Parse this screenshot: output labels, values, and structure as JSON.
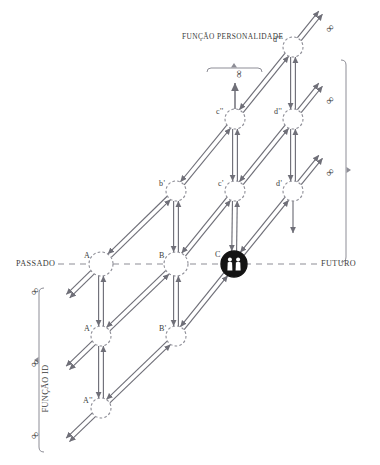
{
  "diagram": {
    "title": "FUNÇÃO PERSONALIDADE",
    "axis_left_label": "PASSADO",
    "axis_right_label": "FUTURO",
    "bracket_right_label": "FUNÇÃO DE ATO (EGO)",
    "bracket_left_label": "FUNÇÃO ID",
    "infinity_symbol": "∞",
    "colors": {
      "line": "#6f6f78",
      "node_stroke": "#8d8d96",
      "node_fill": "#ffffff",
      "highlight_fill": "#141414",
      "highlight_figure": "#ffffff",
      "text": "#3a3a3a",
      "dash_axis": "#8d8d96"
    },
    "nodes": [
      {
        "id": "d3",
        "label": "d'''",
        "x": 293,
        "y": 47,
        "r": 10,
        "label_dx": -20,
        "label_dy": -6,
        "highlight": false
      },
      {
        "id": "c2",
        "label": "c''",
        "x": 235,
        "y": 119,
        "r": 10,
        "label_dx": -19,
        "label_dy": -6,
        "highlight": false
      },
      {
        "id": "d2",
        "label": "d''",
        "x": 293,
        "y": 119,
        "r": 10,
        "label_dx": -19,
        "label_dy": -6,
        "highlight": false
      },
      {
        "id": "b1",
        "label": "b'",
        "x": 176,
        "y": 191,
        "r": 10,
        "label_dx": -17,
        "label_dy": -6,
        "highlight": false
      },
      {
        "id": "c1",
        "label": "c'",
        "x": 235,
        "y": 191,
        "r": 10,
        "label_dx": -17,
        "label_dy": -6,
        "highlight": false
      },
      {
        "id": "d1",
        "label": "d'",
        "x": 293,
        "y": 191,
        "r": 10,
        "label_dx": -17,
        "label_dy": -6,
        "highlight": false
      },
      {
        "id": "A",
        "label": "A",
        "x": 101,
        "y": 264,
        "r": 12,
        "label_dx": -17,
        "label_dy": -7,
        "highlight": false
      },
      {
        "id": "B",
        "label": "B",
        "x": 176,
        "y": 264,
        "r": 12,
        "label_dx": -17,
        "label_dy": -7,
        "highlight": false
      },
      {
        "id": "C",
        "label": "C",
        "x": 234,
        "y": 264,
        "r": 13,
        "label_dx": -19,
        "label_dy": -8,
        "highlight": true
      },
      {
        "id": "Ap",
        "label": "A'",
        "x": 101,
        "y": 336,
        "r": 10,
        "label_dx": -17,
        "label_dy": -6,
        "highlight": false
      },
      {
        "id": "Bp",
        "label": "B'",
        "x": 176,
        "y": 336,
        "r": 10,
        "label_dx": -17,
        "label_dy": -6,
        "highlight": false
      },
      {
        "id": "App",
        "label": "A''",
        "x": 101,
        "y": 408,
        "r": 10,
        "label_dx": -18,
        "label_dy": -6,
        "highlight": false
      }
    ],
    "vertical_pairs": [
      {
        "from": "d3",
        "to": "d2"
      },
      {
        "from": "d2",
        "to": "d1"
      },
      {
        "from": "c2",
        "to": "c1"
      },
      {
        "from": "c1",
        "to": "C"
      },
      {
        "from": "b1",
        "to": "B"
      },
      {
        "from": "B",
        "to": "Bp"
      },
      {
        "from": "A",
        "to": "Ap"
      },
      {
        "from": "Ap",
        "to": "App"
      }
    ],
    "diagonal_chains": [
      [
        "App",
        "Bp",
        "C",
        "d1"
      ],
      [
        "Ap",
        "B",
        "c1",
        "d2"
      ],
      [
        "A",
        "b1",
        "c2",
        "d3"
      ]
    ],
    "infinity_markers": [
      {
        "x": 330,
        "y": 28,
        "rot": -45
      },
      {
        "x": 330,
        "y": 100,
        "rot": -45
      },
      {
        "x": 330,
        "y": 172,
        "rot": -45
      },
      {
        "x": 239,
        "y": 74,
        "rot": 90
      },
      {
        "x": 35,
        "y": 291,
        "rot": -45
      },
      {
        "x": 35,
        "y": 363,
        "rot": -45
      },
      {
        "x": 35,
        "y": 435,
        "rot": -45
      }
    ]
  }
}
